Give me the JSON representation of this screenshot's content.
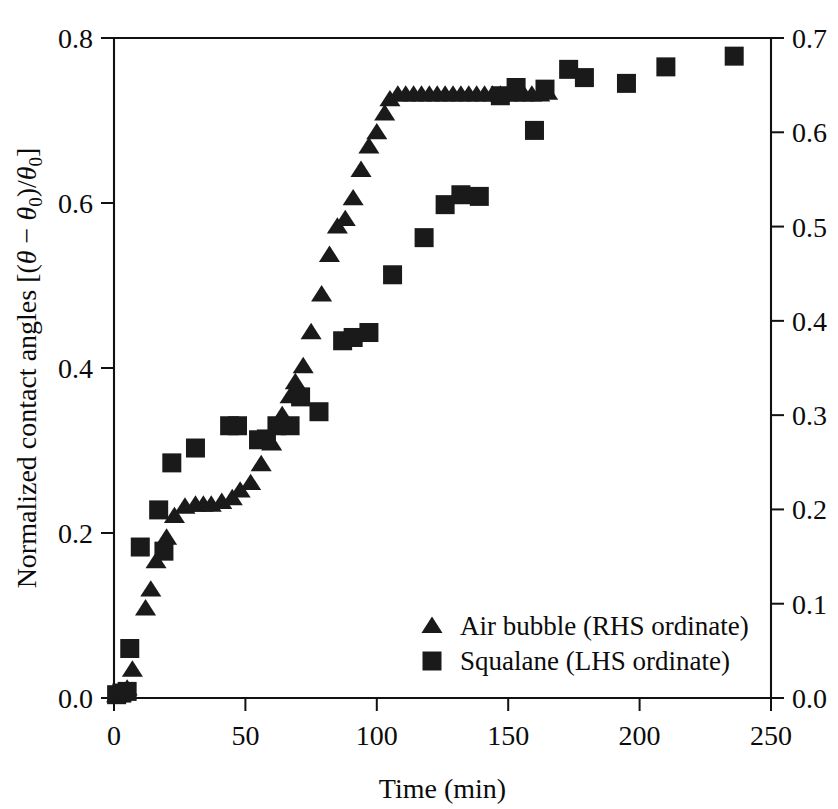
{
  "figure": {
    "width": 838,
    "height": 809,
    "background": "#ffffff",
    "ink_color": "#1a1a1a"
  },
  "axes": {
    "left": {
      "label_plain": "Normalized contact angles [(θ − θ₀)/θ₀]",
      "label_prefix": "Normalized contact angles [(",
      "label_theta": "θ",
      "label_minus": " − ",
      "label_theta0": "θ",
      "label_sub0": "0",
      "label_slash": ")/",
      "label_theta0b": "θ",
      "label_sub0b": "0",
      "label_suffix": "]",
      "ticks": [
        "0.0",
        "0.2",
        "0.4",
        "0.6",
        "0.8"
      ],
      "min": 0.0,
      "max": 0.8
    },
    "right": {
      "label": "",
      "ticks": [
        "0.0",
        "0.1",
        "0.2",
        "0.3",
        "0.4",
        "0.5",
        "0.6",
        "0.7"
      ],
      "min": 0.0,
      "max": 0.7
    },
    "bottom": {
      "label": "Time (min)",
      "ticks": [
        "0",
        "50",
        "100",
        "150",
        "200",
        "250"
      ],
      "min": 0,
      "max": 250
    }
  },
  "legend": {
    "position": "inside-lower-right",
    "items": [
      {
        "marker": "triangle",
        "label": "Air bubble (RHS ordinate)"
      },
      {
        "marker": "square",
        "label": "Squalane (LHS ordinate)"
      }
    ]
  },
  "chart_data": {
    "type": "scatter",
    "title": "",
    "xlabel": "Time (min)",
    "ylabel": "Normalized contact angles [(θ − θ₀)/θ₀]",
    "xlim": [
      0,
      250
    ],
    "ylim_left": [
      0.0,
      0.8
    ],
    "ylim_right": [
      0.0,
      0.7
    ],
    "grid": false,
    "legend_position": "lower right (inside)",
    "series": [
      {
        "name": "Air bubble (RHS ordinate)",
        "marker": "triangle",
        "axis": "right",
        "points": [
          [
            1,
            0.003
          ],
          [
            3,
            0.006
          ],
          [
            5,
            0.01
          ],
          [
            7,
            0.03
          ],
          [
            12,
            0.095
          ],
          [
            14,
            0.115
          ],
          [
            16,
            0.145
          ],
          [
            20,
            0.17
          ],
          [
            23,
            0.193
          ],
          [
            27,
            0.203
          ],
          [
            31,
            0.205
          ],
          [
            34,
            0.205
          ],
          [
            37,
            0.205
          ],
          [
            41,
            0.208
          ],
          [
            45,
            0.212
          ],
          [
            48,
            0.22
          ],
          [
            52,
            0.228
          ],
          [
            56,
            0.248
          ],
          [
            60,
            0.27
          ],
          [
            64,
            0.3
          ],
          [
            67,
            0.32
          ],
          [
            69,
            0.335
          ],
          [
            72,
            0.352
          ],
          [
            75,
            0.388
          ],
          [
            79,
            0.428
          ],
          [
            82,
            0.47
          ],
          [
            85,
            0.5
          ],
          [
            88,
            0.508
          ],
          [
            91,
            0.53
          ],
          [
            94,
            0.56
          ],
          [
            97,
            0.585
          ],
          [
            100,
            0.6
          ],
          [
            103,
            0.62
          ],
          [
            105,
            0.635
          ],
          [
            108,
            0.64
          ],
          [
            111,
            0.64
          ],
          [
            114,
            0.64
          ],
          [
            117,
            0.64
          ],
          [
            120,
            0.64
          ],
          [
            123,
            0.64
          ],
          [
            126,
            0.64
          ],
          [
            129,
            0.64
          ],
          [
            132,
            0.64
          ],
          [
            135,
            0.64
          ],
          [
            138,
            0.64
          ],
          [
            141,
            0.64
          ],
          [
            144,
            0.64
          ],
          [
            147,
            0.64
          ],
          [
            150,
            0.64
          ],
          [
            153,
            0.64
          ],
          [
            156,
            0.64
          ],
          [
            159,
            0.64
          ],
          [
            162,
            0.64
          ],
          [
            165,
            0.642
          ]
        ]
      },
      {
        "name": "Squalane (LHS ordinate)",
        "marker": "square",
        "axis": "left",
        "points": [
          [
            1,
            0.004
          ],
          [
            3,
            0.006
          ],
          [
            5,
            0.008
          ],
          [
            6,
            0.06
          ],
          [
            10,
            0.183
          ],
          [
            17,
            0.228
          ],
          [
            19,
            0.178
          ],
          [
            22,
            0.285
          ],
          [
            31,
            0.303
          ],
          [
            44,
            0.33
          ],
          [
            47,
            0.33
          ],
          [
            55,
            0.313
          ],
          [
            58,
            0.314
          ],
          [
            62,
            0.33
          ],
          [
            67,
            0.33
          ],
          [
            71,
            0.365
          ],
          [
            78,
            0.347
          ],
          [
            87,
            0.433
          ],
          [
            91,
            0.437
          ],
          [
            97,
            0.443
          ],
          [
            106,
            0.513
          ],
          [
            118,
            0.558
          ],
          [
            126,
            0.598
          ],
          [
            132,
            0.61
          ],
          [
            139,
            0.608
          ],
          [
            147,
            0.73
          ],
          [
            153,
            0.74
          ],
          [
            160,
            0.688
          ],
          [
            164,
            0.738
          ],
          [
            173,
            0.762
          ],
          [
            179,
            0.752
          ],
          [
            195,
            0.745
          ],
          [
            210,
            0.765
          ],
          [
            236,
            0.778
          ]
        ]
      }
    ]
  }
}
